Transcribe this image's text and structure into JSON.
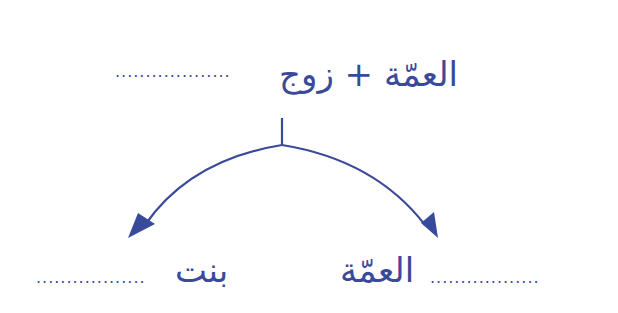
{
  "diagram": {
    "type": "family-tree",
    "color": "#3a4a9a",
    "parent": {
      "label": "العمّة + زوج",
      "blank": "..................."
    },
    "children": [
      {
        "position": "right",
        "label": "العمّة",
        "blank_before": "..................",
        "prefix": ""
      },
      {
        "position": "left",
        "label": "بنت",
        "blank_after": "..................",
        "prefix": ""
      }
    ],
    "connectors": {
      "stem": "vertical line",
      "arrows": [
        "left-down arc arrow",
        "right-down arc arrow"
      ]
    }
  }
}
